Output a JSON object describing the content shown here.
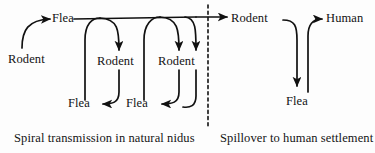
{
  "figure": {
    "type": "flow-diagram",
    "background_color": "#fdfdfd",
    "stroke_color": "#111111",
    "panels": [
      {
        "id": "natural-nidus",
        "caption": "Spiral transmission in natural nidus"
      },
      {
        "id": "human-spillover",
        "caption": "Spillover to human settlement"
      }
    ],
    "divider": {
      "name": "dashed-divider",
      "style": "dashed",
      "orientation": "vertical"
    }
  },
  "nodes": {
    "left_panel": [
      {
        "id": "rodent-0",
        "label": "Rodent"
      },
      {
        "id": "flea-0",
        "label": "Flea"
      },
      {
        "id": "rodent-1",
        "label": "Rodent"
      },
      {
        "id": "flea-1",
        "label": "Flea"
      },
      {
        "id": "rodent-2",
        "label": "Rodent"
      },
      {
        "id": "flea-2",
        "label": "Flea"
      }
    ],
    "right_panel": [
      {
        "id": "rodent-h",
        "label": "Rodent"
      },
      {
        "id": "flea-h",
        "label": "Flea"
      },
      {
        "id": "human",
        "label": "Human"
      }
    ]
  },
  "edges": [
    {
      "from": "rodent-0",
      "to": "flea-0",
      "arrow": true
    },
    {
      "from": "flea-0",
      "to": "rodent-1",
      "arrow": true
    },
    {
      "from": "rodent-1",
      "to": "flea-1",
      "arrow": true
    },
    {
      "from": "flea-1",
      "to": "rodent-2",
      "arrow": true
    },
    {
      "from": "rodent-2",
      "to": "flea-2",
      "arrow": true
    },
    {
      "from": "flea-0",
      "to": "rodent-h",
      "arrow": true
    },
    {
      "from": "rodent-h",
      "to": "flea-h",
      "arrow": true
    },
    {
      "from": "flea-h",
      "to": "human",
      "arrow": true
    }
  ],
  "captions": {
    "left": "Spiral transmission in natural nidus",
    "right": "Spillover to human settlement"
  }
}
